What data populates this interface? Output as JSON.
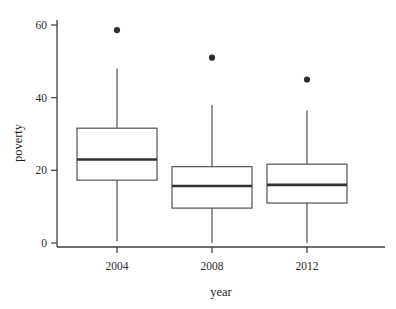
{
  "chart_data": {
    "type": "box",
    "title": "",
    "xlabel": "year",
    "ylabel": "poverty",
    "categories": [
      "2004",
      "2008",
      "2012"
    ],
    "yticks": [
      0,
      20,
      40,
      60
    ],
    "ylim": [
      -3,
      62
    ],
    "grid": false,
    "legend": "none",
    "boxes": [
      {
        "category": "2004",
        "whisker_low": 0.5,
        "q1": 17.3,
        "median": 23.0,
        "q3": 31.6,
        "whisker_high": 48.0,
        "outliers": [
          58.6
        ]
      },
      {
        "category": "2008",
        "whisker_low": 0.0,
        "q1": 9.6,
        "median": 15.7,
        "q3": 21.0,
        "whisker_high": 38.0,
        "outliers": [
          51.0
        ]
      },
      {
        "category": "2012",
        "whisker_low": 0.0,
        "q1": 11.0,
        "median": 16.0,
        "q3": 21.7,
        "whisker_high": 36.5,
        "outliers": [
          45.0
        ]
      }
    ]
  },
  "axes": {
    "y_tick_labels": [
      "0",
      "20",
      "40",
      "60"
    ],
    "x_tick_labels": [
      "2004",
      "2008",
      "2012"
    ],
    "y_title": "poverty",
    "x_title": "year"
  },
  "colors": {
    "box_stroke": "#4a4a4a",
    "median": "#333333",
    "outlier": "#2b2b2b",
    "axis": "#3d3d3d",
    "background": "#ffffff"
  }
}
